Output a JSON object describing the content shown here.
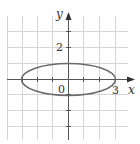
{
  "diagram": {
    "type": "ellipse-on-grid",
    "axes": {
      "x_label": "x",
      "y_label": "y",
      "origin_label": "0"
    },
    "tick_labels": {
      "x": "3",
      "y": "2"
    },
    "ellipse": {
      "center": [
        0,
        0
      ],
      "semi_major_x": 3,
      "semi_minor_y": 1
    },
    "grid": {
      "x_range": [
        -4,
        3
      ],
      "y_range": [
        -4,
        3
      ],
      "step": 1
    },
    "colors": {
      "grid": "#d0d0d0",
      "axis": "#555555",
      "curve": "#6a6a6a",
      "text": "#333333"
    }
  }
}
